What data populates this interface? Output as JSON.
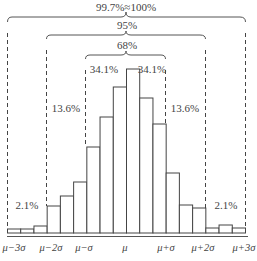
{
  "chart_data": {
    "type": "bar",
    "title": "",
    "xlabel": "",
    "ylabel": "",
    "grid": false,
    "legend": "none",
    "bins": [
      {
        "x0": -3.0,
        "x1": -2.667,
        "height": 4
      },
      {
        "x0": -2.667,
        "x1": -2.333,
        "height": 4
      },
      {
        "x0": -2.333,
        "x1": -2.0,
        "height": 7
      },
      {
        "x0": -2.0,
        "x1": -1.667,
        "height": 27
      },
      {
        "x0": -1.667,
        "x1": -1.333,
        "height": 37
      },
      {
        "x0": -1.333,
        "x1": -1.0,
        "height": 51
      },
      {
        "x0": -1.0,
        "x1": -0.667,
        "height": 86
      },
      {
        "x0": -0.667,
        "x1": -0.333,
        "height": 116
      },
      {
        "x0": -0.333,
        "x1": 0.0,
        "height": 146
      },
      {
        "x0": 0.0,
        "x1": 0.333,
        "height": 164
      },
      {
        "x0": 0.333,
        "x1": 0.667,
        "height": 135
      },
      {
        "x0": 0.667,
        "x1": 1.0,
        "height": 109
      },
      {
        "x0": 1.0,
        "x1": 1.333,
        "height": 60
      },
      {
        "x0": 1.333,
        "x1": 1.667,
        "height": 28
      },
      {
        "x0": 1.667,
        "x1": 2.0,
        "height": 25
      },
      {
        "x0": 2.0,
        "x1": 2.333,
        "height": 5
      },
      {
        "x0": 2.333,
        "x1": 2.667,
        "height": 8
      },
      {
        "x0": 2.667,
        "x1": 3.0,
        "height": 5
      }
    ],
    "tick_labels": [
      "μ−3σ",
      "μ−2σ",
      "μ−σ",
      "μ",
      "μ+σ",
      "μ+2σ",
      "μ+3σ"
    ],
    "annotations": {
      "brace_3sigma": "99.7%≈100%",
      "brace_2sigma": "95%",
      "brace_1sigma": "68%",
      "left_1sigma": "34.1%",
      "right_1sigma": "34.1%",
      "left_2sigma": "13.6%",
      "right_2sigma": "13.6%",
      "left_3sigma": "2.1%",
      "right_3sigma": "2.1%"
    }
  }
}
